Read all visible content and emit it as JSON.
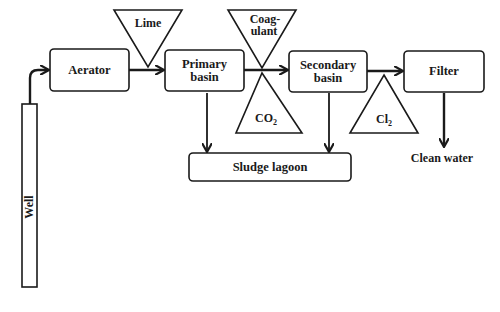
{
  "diagram": {
    "type": "process-flow",
    "nodes": {
      "well": {
        "label": "Well"
      },
      "aerator": {
        "label": "Aerator"
      },
      "primary": {
        "label_line1": "Primary",
        "label_line2": "basin"
      },
      "secondary": {
        "label_line1": "Secondary",
        "label_line2": "basin"
      },
      "filter": {
        "label": "Filter"
      },
      "sludge": {
        "label": "Sludge lagoon"
      },
      "clean": {
        "label": "Clean water"
      }
    },
    "additives": {
      "lime": {
        "label": "Lime"
      },
      "coagulant": {
        "label_line1": "Coag-",
        "label_line2": "ulant"
      },
      "co2": {
        "label_main": "CO",
        "label_sub": "2"
      },
      "cl2": {
        "label_main": "Cl",
        "label_sub": "2"
      }
    },
    "edges": [
      {
        "from": "Well",
        "to": "Aerator"
      },
      {
        "from": "Aerator",
        "to": "Primary basin",
        "additive": "Lime"
      },
      {
        "from": "Primary basin",
        "to": "Secondary basin",
        "additive": [
          "Coagulant",
          "CO2"
        ]
      },
      {
        "from": "Secondary basin",
        "to": "Filter",
        "additive": "Cl2"
      },
      {
        "from": "Filter",
        "to": "Clean water"
      },
      {
        "from": "Primary basin",
        "to": "Sludge lagoon"
      },
      {
        "from": "Secondary basin",
        "to": "Sludge lagoon"
      }
    ],
    "colors": {
      "stroke": "#1a1a1a",
      "background": "#ffffff"
    }
  }
}
